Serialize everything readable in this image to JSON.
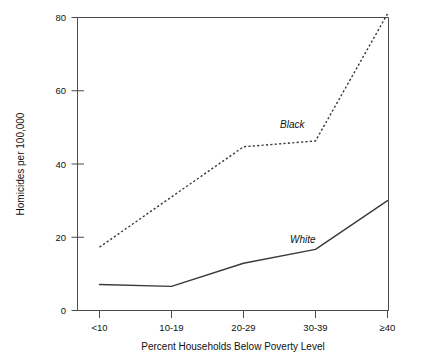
{
  "chart_data": {
    "type": "line",
    "title": "",
    "xlabel": "Percent Households Below Poverty Level",
    "ylabel": "Homicides per 100,000",
    "categories": [
      "<10",
      "10-19",
      "20-29",
      "30-39",
      "≥40"
    ],
    "ylim": [
      0,
      80
    ],
    "yticks": [
      0,
      20,
      40,
      60,
      80
    ],
    "ytick_labels": [
      "0",
      "20",
      "40",
      "60",
      "80"
    ],
    "grid": false,
    "legend_position": "inline-annotations",
    "series": [
      {
        "name": "Black",
        "style": "dashed",
        "values": [
          17.3,
          31.0,
          44.7,
          46.3,
          81.0
        ],
        "label_x_category": "30-39",
        "label_value": 52
      },
      {
        "name": "White",
        "style": "solid",
        "values": [
          7.1,
          6.6,
          12.9,
          16.7,
          30.0
        ],
        "label_x_category": "30-39",
        "label_value": 21
      }
    ],
    "annotations": [
      {
        "text": "Black",
        "italic": true
      },
      {
        "text": "White",
        "italic": true
      }
    ]
  },
  "axis": {
    "y_label_text": "Homicides per 100,000",
    "x_label_text": "Percent Households Below Poverty Level",
    "y_tick_0": "0",
    "y_tick_20": "20",
    "y_tick_40": "40",
    "y_tick_60": "60",
    "y_tick_80": "80",
    "x_tick_1": "<10",
    "x_tick_2": "10-19",
    "x_tick_3": "20-29",
    "x_tick_4": "30-39",
    "x_tick_5": "≥40"
  },
  "series_labels": {
    "black": "Black",
    "white": "White"
  },
  "colors": {
    "line": "#3a3a3a",
    "axis": "#4a4a4a",
    "text": "#111111",
    "background": "#ffffff"
  }
}
